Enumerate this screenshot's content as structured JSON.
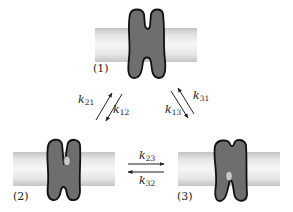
{
  "diagram": {
    "colors": {
      "protein_fill": "#6e6e6e",
      "protein_stroke": "#111111",
      "membrane_core": "#f4f4f4",
      "membrane_edge": "#c4c4c4",
      "substrate_fill": "#c8c8c8",
      "arrow": "#222222"
    },
    "states": [
      {
        "id": "1",
        "label": "(1)",
        "substrate": "none"
      },
      {
        "id": "2",
        "label": "(2)",
        "substrate": "bound-upper"
      },
      {
        "id": "3",
        "label": "(3)",
        "substrate": "bound-lower"
      }
    ],
    "rates": {
      "k21": {
        "symbol": "k",
        "sub": "21",
        "from": "2",
        "to": "1"
      },
      "k12": {
        "symbol": "k",
        "sub": "12",
        "from": "1",
        "to": "2"
      },
      "k31": {
        "symbol": "k",
        "sub": "31",
        "from": "3",
        "to": "1"
      },
      "k13": {
        "symbol": "k",
        "sub": "13",
        "from": "1",
        "to": "3"
      },
      "k23": {
        "symbol": "k",
        "sub": "23",
        "from": "2",
        "to": "3"
      },
      "k32": {
        "symbol": "k",
        "sub": "32",
        "from": "3",
        "to": "2"
      }
    }
  }
}
